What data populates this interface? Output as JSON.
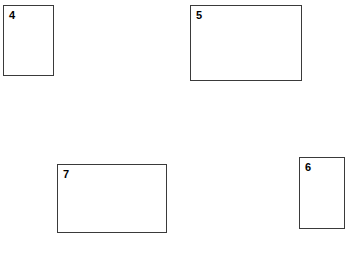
{
  "canvas": {
    "width": 353,
    "height": 255,
    "background_color": "#ffffff"
  },
  "style": {
    "border_color": "#3a3a3a",
    "border_width": 1,
    "fill_color": "#ffffff",
    "label_color": "#000000"
  },
  "shapes": [
    {
      "name": "rectangle-4",
      "label": "4",
      "x": 3,
      "y": 5,
      "width": 51,
      "height": 71,
      "orientation": "portrait"
    },
    {
      "name": "rectangle-5",
      "label": "5",
      "x": 190,
      "y": 5,
      "width": 112,
      "height": 76,
      "orientation": "landscape"
    },
    {
      "name": "rectangle-7",
      "label": "7",
      "x": 57,
      "y": 164,
      "width": 110,
      "height": 69,
      "orientation": "landscape"
    },
    {
      "name": "rectangle-6",
      "label": "6",
      "x": 299,
      "y": 157,
      "width": 46,
      "height": 72,
      "orientation": "portrait"
    }
  ]
}
